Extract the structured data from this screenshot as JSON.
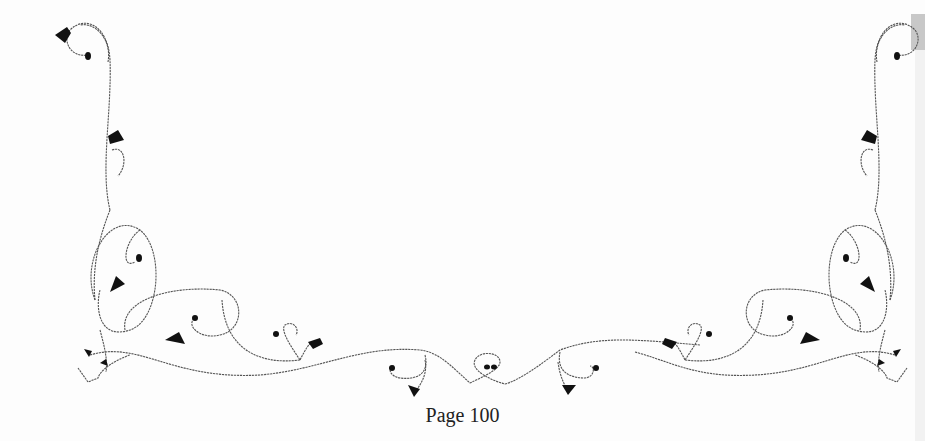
{
  "page": {
    "footer_label": "Page 100",
    "ornament": "floral-vine-border"
  },
  "colors": {
    "background": "#fdfdfd",
    "ink": "#111111",
    "text": "#222222"
  }
}
